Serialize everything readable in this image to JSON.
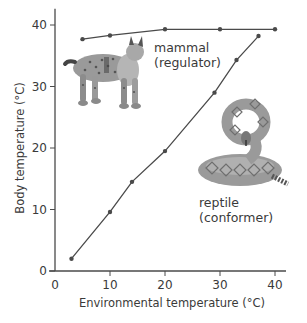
{
  "chart_data": {
    "type": "line",
    "title": "",
    "xlabel": "Environmental temperature (°C)",
    "ylabel": "Body temperature (°C)",
    "xlim": [
      0,
      42
    ],
    "ylim": [
      0,
      42
    ],
    "xticks": [
      0,
      10,
      20,
      30,
      40
    ],
    "yticks": [
      0,
      10,
      20,
      30,
      40
    ],
    "grid": false,
    "legend": "none (inline annotations)",
    "series": [
      {
        "name": "mammal (regulator)",
        "label_line1": "mammal",
        "label_line2": "(regulator)",
        "illustration": "lynx",
        "x": [
          5,
          10,
          20,
          30,
          40
        ],
        "y": [
          37.7,
          38.3,
          39.3,
          39.3,
          39.3
        ]
      },
      {
        "name": "reptile (conformer)",
        "label_line1": "reptile",
        "label_line2": "(conformer)",
        "illustration": "rattlesnake",
        "x": [
          3,
          10,
          14,
          20,
          29,
          33,
          37
        ],
        "y": [
          2,
          9.6,
          14.5,
          19.5,
          29,
          34.3,
          38.2
        ]
      }
    ]
  },
  "colors": {
    "line": "#4a4a4a",
    "axis": "#4a4a4a",
    "text": "#3a3a3a",
    "illustration_fill": "#9a9a9a",
    "illustration_dark": "#6e6e6e"
  }
}
